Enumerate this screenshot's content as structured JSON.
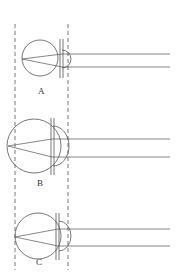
{
  "figure": {
    "colors": {
      "line": "#555555",
      "background": "#ffffff"
    },
    "guides": [
      {
        "x": 15
      },
      {
        "x": 68
      }
    ],
    "eyes": [
      {
        "label": "A",
        "cx": 40,
        "cy": 58,
        "r": 18,
        "lensX": 62,
        "rayY1": 54,
        "rayY2": 67
      },
      {
        "label": "B",
        "cx": 34,
        "cy": 146,
        "r": 27,
        "lensX": 53,
        "rayY1": 138,
        "rayY2": 156
      },
      {
        "label": "C",
        "cx": 38,
        "cy": 236,
        "r": 23,
        "lensX": 58,
        "rayY1": 228,
        "rayY2": 245
      }
    ]
  }
}
